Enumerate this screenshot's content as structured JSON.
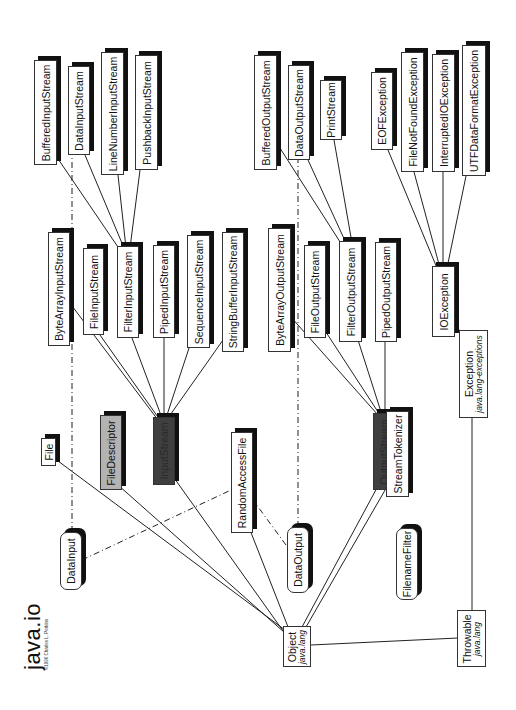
{
  "title": "java.io",
  "copyright": "©1996 Charles L. Perkins",
  "colors": {
    "box_fill": "#ffffff",
    "box_shadow": "#111111",
    "file_descriptor_fill": "#b3b3b3",
    "abstract_stream_fill": "#3f3f3f",
    "line": "#222222"
  },
  "nodes": {
    "buffered_input_stream": "BufferedInputStream",
    "data_input_stream": "DataInputStream",
    "line_number_input_stream": "LineNumberInputStream",
    "pushback_input_stream": "PushbackInputStream",
    "byte_array_input_stream": "ByteArrayInputStream",
    "file_input_stream": "FileInputStream",
    "filter_input_stream": "FilterInputStream",
    "piped_input_stream": "PipedInputStream",
    "sequence_input_stream": "SequenceInputStream",
    "string_buffer_input_stream": "StringBufferInputStream",
    "file": "File",
    "file_descriptor": "FileDescriptor",
    "input_stream": "InputStream",
    "random_access_file": "RandomAccessFile",
    "data_input": "DataInput",
    "data_output": "DataOutput",
    "output_stream": "OutputStream",
    "stream_tokenizer": "StreamTokenizer",
    "filename_filter": "FilenameFilter",
    "buffered_output_stream": "BufferedOutputStream",
    "data_output_stream": "DataOutputStream",
    "print_stream": "PrintStream",
    "byte_array_output_stream": "ByteArrayOutputStream",
    "file_output_stream": "FileOutputStream",
    "filter_output_stream": "FilterOutputStream",
    "piped_output_stream": "PipedOutputStream",
    "eof_exception": "EOFException",
    "file_not_found_exception": "FileNotFoundException",
    "interrupted_io_exception": "InterruptedIOException",
    "utf_data_format_exception": "UTFDataFormatException",
    "io_exception": "IOException",
    "exception": {
      "name": "Exception",
      "package": "java.lang-exceptions"
    },
    "object": {
      "name": "Object",
      "package": "java.lang"
    },
    "throwable": {
      "name": "Throwable",
      "package": "java.lang"
    }
  },
  "legend": {
    "solid_line": "extends",
    "dash_dot_line": "implements"
  }
}
